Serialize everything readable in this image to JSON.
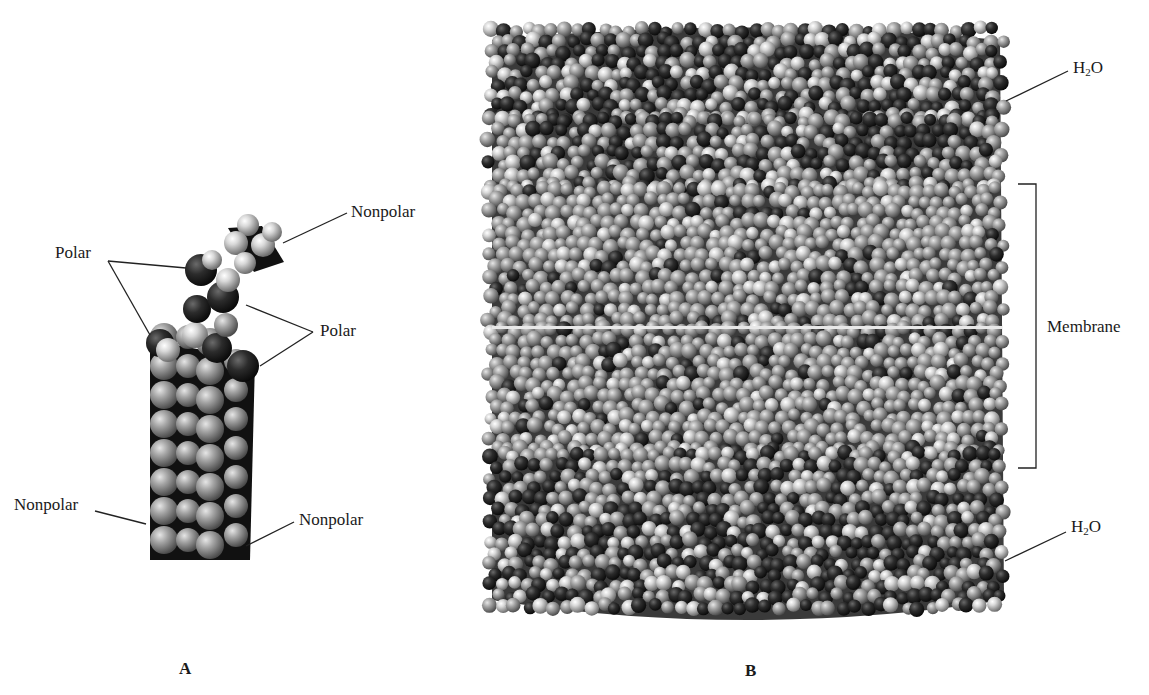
{
  "figure": {
    "panel_a": {
      "panel_label": "A",
      "description": "Space-filling model of a single phospholipid molecule",
      "labels": {
        "nonpolar_top": "Nonpolar",
        "polar_left": "Polar",
        "polar_right": "Polar",
        "nonpolar_left": "Nonpolar",
        "nonpolar_right": "Nonpolar"
      }
    },
    "panel_b": {
      "panel_label": "B",
      "description": "Space-filling model of a lipid bilayer membrane between water layers",
      "labels": {
        "water_top_main": "H",
        "water_top_sub": "2",
        "water_top_end": "O",
        "membrane": "Membrane",
        "water_bottom_main": "H",
        "water_bottom_sub": "2",
        "water_bottom_end": "O"
      }
    },
    "colors": {
      "background": "#ffffff",
      "polar_atom": "#2a2a2a",
      "nonpolar_atom": "#a8a8a8",
      "light_atom": "#d9d9d9",
      "line": "#222222"
    }
  }
}
